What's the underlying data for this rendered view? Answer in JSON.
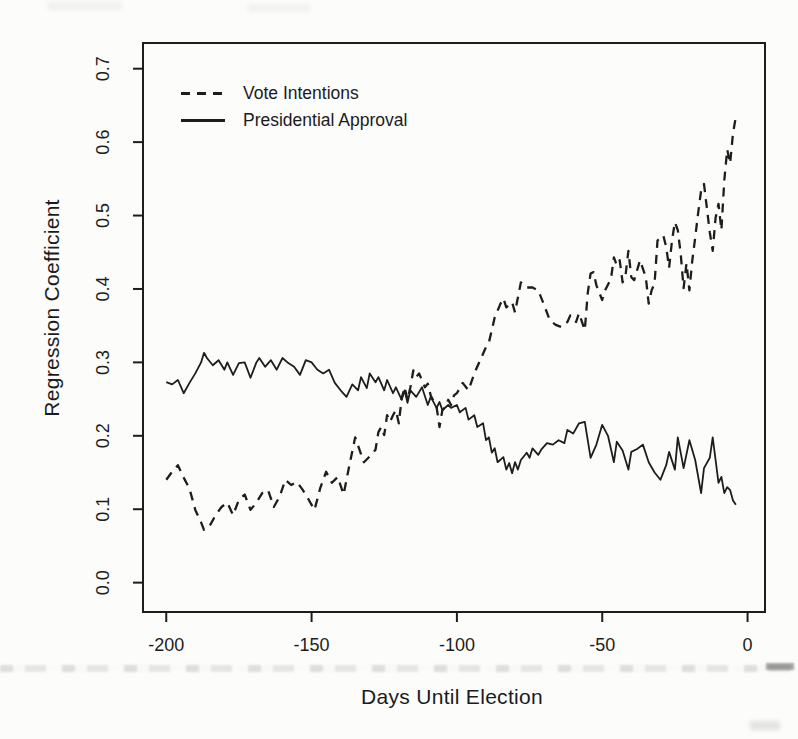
{
  "figure": {
    "background": "#fcfcfb",
    "ink_color": "#1d1d1d"
  },
  "chart_data": {
    "type": "line",
    "title": "",
    "xlabel": "Days Until Election",
    "ylabel": "Regression Coefficient",
    "x_ticks": [
      -200,
      -150,
      -100,
      -50,
      0
    ],
    "x_tick_labels": [
      "-200",
      "-150",
      "-100",
      "-50",
      "0"
    ],
    "y_ticks": [
      0.0,
      0.1,
      0.2,
      0.3,
      0.4,
      0.5,
      0.6,
      0.7
    ],
    "y_tick_labels": [
      "0.0",
      "0.1",
      "0.2",
      "0.3",
      "0.4",
      "0.5",
      "0.6",
      "0.7"
    ],
    "xlim": [
      -208,
      6
    ],
    "ylim": [
      -0.04,
      0.735
    ],
    "grid": false,
    "legend": {
      "position": "top-left-inside",
      "entries": [
        {
          "label": "Vote Intentions",
          "line_style": "dashed"
        },
        {
          "label": "Presidential Approval",
          "line_style": "solid"
        }
      ]
    },
    "series": [
      {
        "name": "Vote Intentions",
        "style": "dashed",
        "points": [
          [
            -200,
            0.14
          ],
          [
            -198,
            0.151
          ],
          [
            -196,
            0.16
          ],
          [
            -194,
            0.143
          ],
          [
            -192,
            0.128
          ],
          [
            -190,
            0.099
          ],
          [
            -188,
            0.082
          ],
          [
            -187,
            0.072
          ],
          [
            -185,
            0.078
          ],
          [
            -183,
            0.092
          ],
          [
            -181,
            0.103
          ],
          [
            -179,
            0.109
          ],
          [
            -177,
            0.092
          ],
          [
            -175,
            0.113
          ],
          [
            -173,
            0.12
          ],
          [
            -171,
            0.099
          ],
          [
            -169,
            0.109
          ],
          [
            -167,
            0.122
          ],
          [
            -165,
            0.126
          ],
          [
            -163,
            0.103
          ],
          [
            -161,
            0.117
          ],
          [
            -159,
            0.14
          ],
          [
            -157,
            0.133
          ],
          [
            -155,
            0.137
          ],
          [
            -153,
            0.126
          ],
          [
            -151,
            0.113
          ],
          [
            -149,
            0.099
          ],
          [
            -147,
            0.129
          ],
          [
            -145,
            0.151
          ],
          [
            -143,
            0.136
          ],
          [
            -141,
            0.144
          ],
          [
            -139,
            0.12
          ],
          [
            -137,
            0.16
          ],
          [
            -135,
            0.198
          ],
          [
            -133,
            0.175
          ],
          [
            -132,
            0.164
          ],
          [
            -130,
            0.172
          ],
          [
            -128,
            0.181
          ],
          [
            -127,
            0.205
          ],
          [
            -126,
            0.212
          ],
          [
            -125,
            0.201
          ],
          [
            -124,
            0.228
          ],
          [
            -123,
            0.219
          ],
          [
            -122,
            0.228
          ],
          [
            -121,
            0.235
          ],
          [
            -120,
            0.217
          ],
          [
            -119,
            0.251
          ],
          [
            -118,
            0.266
          ],
          [
            -117,
            0.249
          ],
          [
            -116,
            0.266
          ],
          [
            -115,
            0.289
          ],
          [
            -114,
            0.28
          ],
          [
            -113,
            0.285
          ],
          [
            -111,
            0.266
          ],
          [
            -110,
            0.271
          ],
          [
            -109,
            0.255
          ],
          [
            -107,
            0.239
          ],
          [
            -106,
            0.212
          ],
          [
            -105,
            0.235
          ],
          [
            -104,
            0.239
          ],
          [
            -103,
            0.249
          ],
          [
            -102,
            0.242
          ],
          [
            -101,
            0.255
          ],
          [
            -100,
            0.258
          ],
          [
            -98,
            0.272
          ],
          [
            -96,
            0.262
          ],
          [
            -94,
            0.285
          ],
          [
            -92,
            0.303
          ],
          [
            -90,
            0.321
          ],
          [
            -89,
            0.327
          ],
          [
            -87,
            0.361
          ],
          [
            -85,
            0.38
          ],
          [
            -84,
            0.387
          ],
          [
            -83,
            0.375
          ],
          [
            -81,
            0.382
          ],
          [
            -80,
            0.368
          ],
          [
            -78,
            0.409
          ],
          [
            -76,
            0.402
          ],
          [
            -74,
            0.402
          ],
          [
            -72,
            0.398
          ],
          [
            -70,
            0.378
          ],
          [
            -68,
            0.357
          ],
          [
            -66,
            0.351
          ],
          [
            -64,
            0.348
          ],
          [
            -62,
            0.355
          ],
          [
            -61,
            0.364
          ],
          [
            -59,
            0.355
          ],
          [
            -58,
            0.367
          ],
          [
            -56,
            0.344
          ],
          [
            -55,
            0.394
          ],
          [
            -54,
            0.421
          ],
          [
            -53,
            0.423
          ],
          [
            -52,
            0.405
          ],
          [
            -50,
            0.385
          ],
          [
            -49,
            0.398
          ],
          [
            -47,
            0.414
          ],
          [
            -46,
            0.443
          ],
          [
            -45,
            0.432
          ],
          [
            -44,
            0.439
          ],
          [
            -43,
            0.409
          ],
          [
            -42,
            0.418
          ],
          [
            -41,
            0.452
          ],
          [
            -40,
            0.416
          ],
          [
            -39,
            0.412
          ],
          [
            -37,
            0.439
          ],
          [
            -35,
            0.416
          ],
          [
            -34,
            0.38
          ],
          [
            -33,
            0.398
          ],
          [
            -32,
            0.408
          ],
          [
            -31,
            0.466
          ],
          [
            -29,
            0.473
          ],
          [
            -28,
            0.457
          ],
          [
            -27,
            0.429
          ],
          [
            -26,
            0.466
          ],
          [
            -25,
            0.491
          ],
          [
            -24,
            0.48
          ],
          [
            -23,
            0.448
          ],
          [
            -22,
            0.401
          ],
          [
            -21,
            0.435
          ],
          [
            -20,
            0.398
          ],
          [
            -19,
            0.439
          ],
          [
            -18,
            0.47
          ],
          [
            -17,
            0.503
          ],
          [
            -16,
            0.534
          ],
          [
            -15,
            0.543
          ],
          [
            -14,
            0.51
          ],
          [
            -13,
            0.477
          ],
          [
            -12,
            0.452
          ],
          [
            -11,
            0.497
          ],
          [
            -10,
            0.516
          ],
          [
            -9,
            0.48
          ],
          [
            -8,
            0.548
          ],
          [
            -7,
            0.59
          ],
          [
            -6,
            0.571
          ],
          [
            -5,
            0.612
          ],
          [
            -4,
            0.635
          ]
        ]
      },
      {
        "name": "Presidential Approval",
        "style": "solid",
        "points": [
          [
            -200,
            0.273
          ],
          [
            -198,
            0.27
          ],
          [
            -196,
            0.276
          ],
          [
            -194,
            0.258
          ],
          [
            -192,
            0.272
          ],
          [
            -190,
            0.285
          ],
          [
            -188,
            0.3
          ],
          [
            -187,
            0.313
          ],
          [
            -186,
            0.306
          ],
          [
            -184,
            0.296
          ],
          [
            -182,
            0.303
          ],
          [
            -180,
            0.29
          ],
          [
            -179,
            0.3
          ],
          [
            -177,
            0.283
          ],
          [
            -175,
            0.299
          ],
          [
            -173,
            0.3
          ],
          [
            -171,
            0.279
          ],
          [
            -169,
            0.3
          ],
          [
            -168,
            0.306
          ],
          [
            -166,
            0.294
          ],
          [
            -164,
            0.303
          ],
          [
            -162,
            0.29
          ],
          [
            -160,
            0.306
          ],
          [
            -158,
            0.299
          ],
          [
            -156,
            0.294
          ],
          [
            -154,
            0.283
          ],
          [
            -152,
            0.303
          ],
          [
            -150,
            0.3
          ],
          [
            -148,
            0.29
          ],
          [
            -146,
            0.285
          ],
          [
            -144,
            0.29
          ],
          [
            -142,
            0.272
          ],
          [
            -140,
            0.262
          ],
          [
            -138,
            0.253
          ],
          [
            -136,
            0.27
          ],
          [
            -134,
            0.262
          ],
          [
            -133,
            0.28
          ],
          [
            -131,
            0.265
          ],
          [
            -130,
            0.285
          ],
          [
            -128,
            0.273
          ],
          [
            -127,
            0.28
          ],
          [
            -125,
            0.262
          ],
          [
            -124,
            0.276
          ],
          [
            -122,
            0.258
          ],
          [
            -121,
            0.266
          ],
          [
            -119,
            0.249
          ],
          [
            -118,
            0.262
          ],
          [
            -117,
            0.245
          ],
          [
            -116,
            0.262
          ],
          [
            -114,
            0.253
          ],
          [
            -112,
            0.266
          ],
          [
            -110,
            0.242
          ],
          [
            -109,
            0.253
          ],
          [
            -107,
            0.238
          ],
          [
            -106,
            0.246
          ],
          [
            -105,
            0.235
          ],
          [
            -103,
            0.242
          ],
          [
            -102,
            0.238
          ],
          [
            -100,
            0.242
          ],
          [
            -99,
            0.232
          ],
          [
            -97,
            0.238
          ],
          [
            -96,
            0.222
          ],
          [
            -94,
            0.228
          ],
          [
            -93,
            0.212
          ],
          [
            -91,
            0.217
          ],
          [
            -90,
            0.194
          ],
          [
            -89,
            0.198
          ],
          [
            -88,
            0.177
          ],
          [
            -87,
            0.183
          ],
          [
            -86,
            0.164
          ],
          [
            -84,
            0.171
          ],
          [
            -83,
            0.154
          ],
          [
            -82,
            0.163
          ],
          [
            -81,
            0.149
          ],
          [
            -80,
            0.164
          ],
          [
            -79,
            0.154
          ],
          [
            -78,
            0.167
          ],
          [
            -76,
            0.177
          ],
          [
            -75,
            0.17
          ],
          [
            -74,
            0.183
          ],
          [
            -72,
            0.174
          ],
          [
            -71,
            0.181
          ],
          [
            -69,
            0.19
          ],
          [
            -67,
            0.188
          ],
          [
            -65,
            0.194
          ],
          [
            -63,
            0.19
          ],
          [
            -62,
            0.208
          ],
          [
            -60,
            0.203
          ],
          [
            -58,
            0.217
          ],
          [
            -56,
            0.219
          ],
          [
            -54,
            0.17
          ],
          [
            -52,
            0.188
          ],
          [
            -50,
            0.215
          ],
          [
            -48,
            0.2
          ],
          [
            -46,
            0.164
          ],
          [
            -45,
            0.192
          ],
          [
            -43,
            0.18
          ],
          [
            -41,
            0.154
          ],
          [
            -40,
            0.178
          ],
          [
            -38,
            0.182
          ],
          [
            -36,
            0.188
          ],
          [
            -34,
            0.164
          ],
          [
            -32,
            0.15
          ],
          [
            -30,
            0.14
          ],
          [
            -28,
            0.16
          ],
          [
            -27,
            0.178
          ],
          [
            -25,
            0.154
          ],
          [
            -24,
            0.198
          ],
          [
            -22,
            0.156
          ],
          [
            -20,
            0.194
          ],
          [
            -18,
            0.167
          ],
          [
            -16,
            0.122
          ],
          [
            -15,
            0.156
          ],
          [
            -13,
            0.17
          ],
          [
            -12,
            0.198
          ],
          [
            -11,
            0.167
          ],
          [
            -10,
            0.136
          ],
          [
            -9,
            0.144
          ],
          [
            -8,
            0.122
          ],
          [
            -7,
            0.13
          ],
          [
            -6,
            0.126
          ],
          [
            -5,
            0.112
          ],
          [
            -4,
            0.106
          ]
        ]
      }
    ]
  }
}
